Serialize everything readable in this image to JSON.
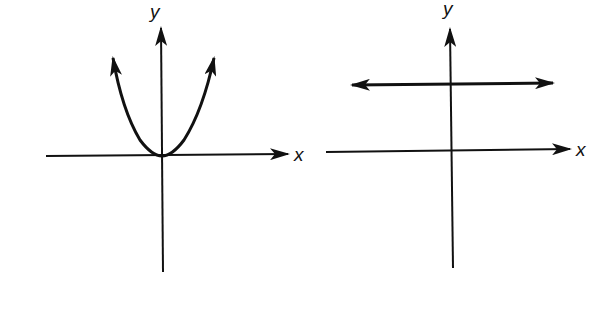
{
  "figure": {
    "colors": {
      "ink": "#111111",
      "background": "#ffffff"
    },
    "graphs": [
      {
        "id": "left",
        "description": "Parabola opening upward with vertex at origin",
        "curve_type": "parabola",
        "equation_form": "y = a x^2, a > 0",
        "x_axis_label": "x",
        "y_axis_label": "y"
      },
      {
        "id": "right",
        "description": "Horizontal line above the x-axis (constant function)",
        "curve_type": "horizontal-line",
        "equation_form": "y = c, c > 0",
        "x_axis_label": "x",
        "y_axis_label": "y"
      }
    ]
  }
}
